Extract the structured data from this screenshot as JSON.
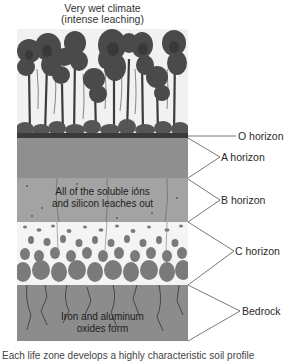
{
  "title": {
    "line1": "Very wet climate",
    "line2": "(intense leaching)"
  },
  "diagram": {
    "layers": [
      {
        "id": "o",
        "label": "O horizon",
        "color": "#3a3a3a"
      },
      {
        "id": "a",
        "label": "A horizon",
        "color": "#8f8f8f"
      },
      {
        "id": "b",
        "label": "B horizon",
        "color": "#a3a3a3",
        "annotation_line1": "All of the soluble ions",
        "annotation_line2": "and silicon leaches out"
      },
      {
        "id": "c",
        "label": "C horizon",
        "color": "#f4f4f4"
      },
      {
        "id": "bedrock",
        "label": "Bedrock",
        "color": "#8c8c8c",
        "annotation_line1": "Iron and aluminum",
        "annotation_line2": "oxides form"
      }
    ]
  },
  "caption": {
    "text": "Each life zone develops a highly characteristic soil profile"
  }
}
